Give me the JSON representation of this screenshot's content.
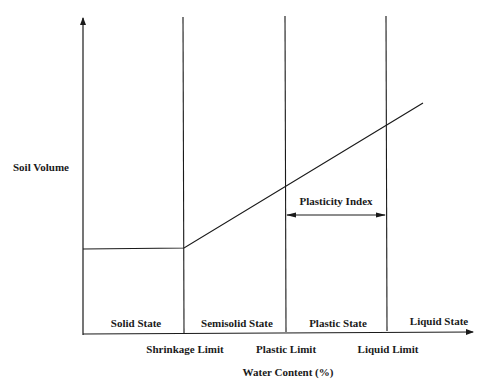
{
  "diagram": {
    "y_axis_label": "Soil Volume",
    "x_axis_label": "Water Content (%)",
    "states": [
      {
        "label": "Solid State"
      },
      {
        "label": "Semisolid State"
      },
      {
        "label": "Plastic State"
      },
      {
        "label": "Liquid State"
      }
    ],
    "limits": [
      {
        "label": "Shrinkage Limit"
      },
      {
        "label": "Plastic Limit"
      },
      {
        "label": "Liquid Limit"
      }
    ],
    "index_label": "Plasticity Index",
    "line_color": "#1a1a1a"
  }
}
